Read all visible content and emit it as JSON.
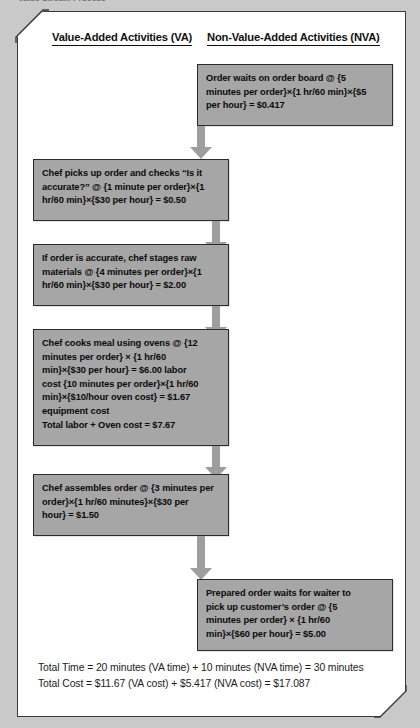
{
  "caption": "Value Stream Process",
  "columns": {
    "va_header": "Value-Added Activities (VA)",
    "nva_header": "Non-Value-Added Activities (NVA)"
  },
  "colors": {
    "node_fill": "#a6a6a6",
    "node_border": "#2b2b2b",
    "arrow": "#9e9e9e",
    "frame_bg": "#ffffff",
    "page_bg": "#c9c9c9",
    "text": "#0a0a0a"
  },
  "nodes": [
    {
      "id": "order-waits-on-board",
      "column": "NVA",
      "lines": [
        "Order waits on order board @ {5",
        "minutes per order}×{1 hr/60 min}×{$5",
        "per hour} = $0.417"
      ]
    },
    {
      "id": "chef-picks-up-order",
      "column": "VA",
      "lines": [
        "Chef picks up order and checks  “Is it",
        "accurate?” @ {1 minute per order}×{1",
        "hr/60 min}×{$30 per hour} = $0.50"
      ]
    },
    {
      "id": "chef-stages-raw-materials",
      "column": "VA",
      "lines": [
        "If order is accurate, chef stages raw",
        "materials @ {4 minutes per order}×{1",
        "hr/60 min}×{$30 per hour} = $2.00"
      ]
    },
    {
      "id": "chef-cooks-meal",
      "column": "VA",
      "lines": [
        "Chef cooks meal using ovens @ {12",
        "minutes per order} ×  {1 hr/60",
        "min}×{$30 per hour} = $6.00 labor",
        "cost {10 minutes per order}×{1 hr/60",
        "min}×{$10/hour oven cost} = $1.67",
        "equipment cost",
        "Total labor + Oven cost = $7.67"
      ]
    },
    {
      "id": "chef-assembles-order",
      "column": "VA",
      "lines": [
        "Chef assembles order @ {3 minutes per",
        "order}×{1 hr/60 minutes}×{$30 per",
        "hour} = $1.50"
      ]
    },
    {
      "id": "prepared-order-waits",
      "column": "NVA",
      "lines": [
        "Prepared order waits for waiter to",
        "pick up customer’s order @ {5",
        "minutes per order} × {1 hr/60",
        "min}×{$60 per hour} = $5.00"
      ]
    }
  ],
  "summary": {
    "time": "Total Time = 20 minutes (VA time) + 10 minutes (NVA time) = 30 minutes",
    "cost": "Total Cost = $11.67 (VA cost) + $5.417 (NVA cost) = $17.087"
  }
}
